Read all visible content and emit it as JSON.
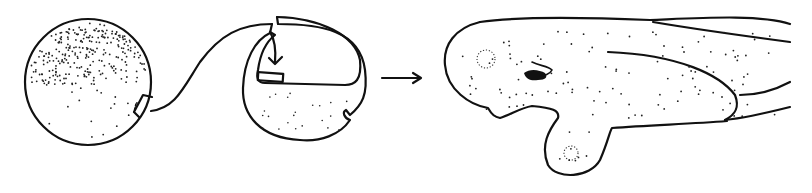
{
  "figure": {
    "panels": [
      {
        "id": "donor",
        "label": "donor embryo (heavily stippled animal half, graft region excised)"
      },
      {
        "id": "host",
        "label": "host embryo with graft being inserted (arrow)"
      },
      {
        "id": "result",
        "label": "resulting larva with dotted eye/ear vesicles and pigment spot"
      }
    ],
    "arrow": {
      "direction": "right"
    },
    "colors": {
      "ink": "#111111",
      "background": "#ffffff"
    }
  }
}
